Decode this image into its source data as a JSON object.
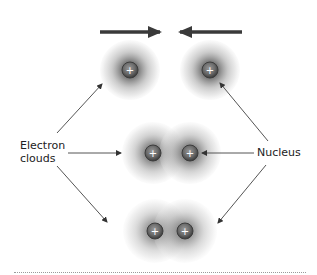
{
  "figure": {
    "labels": {
      "electron_clouds": "Electron clouds",
      "nucleus": "Nucleus"
    },
    "nucleus_symbol": "+",
    "stages": [
      {
        "name": "separate-atoms",
        "nuclei": [
          [
            130,
            70
          ],
          [
            210,
            70
          ]
        ],
        "cloud_radius": 30
      },
      {
        "name": "overlapping-clouds",
        "nuclei": [
          [
            153,
            153
          ],
          [
            190,
            153
          ]
        ],
        "cloud_radius": 30
      },
      {
        "name": "bonded-molecule",
        "nuclei": [
          [
            155,
            231
          ],
          [
            185,
            231
          ]
        ],
        "cloud_radius": 30
      }
    ],
    "motion_arrows": [
      {
        "direction": "right",
        "from": [
          100,
          32
        ],
        "to": [
          160,
          32
        ]
      },
      {
        "direction": "left",
        "from": [
          242,
          32
        ],
        "to": [
          180,
          32
        ]
      }
    ],
    "colors": {
      "cloud_core": "#5a5a5a",
      "cloud_edge": "#e6e6e6",
      "nucleus_fill": "#6e6e6e",
      "nucleus_ring": "#3c3c3c",
      "arrow": "#3a3a3a",
      "pointer": "#555555"
    }
  }
}
